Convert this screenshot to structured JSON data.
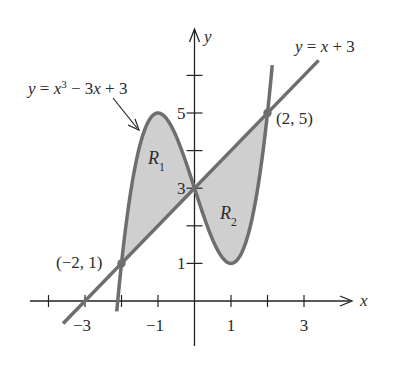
{
  "figure": {
    "curve_label": "y = x³ − 3x + 3",
    "curve_label_parts": {
      "y": "y",
      "eq": " = ",
      "x": "x",
      "exp": "3",
      "rest": " − 3",
      "x2": "x",
      "tail": " + 3"
    },
    "line_label_parts": {
      "y": "y",
      "eq": " = ",
      "x": "x",
      "tail": " + 3"
    },
    "line_label": "y = x + 3",
    "axis_x_label": "x",
    "axis_y_label": "y",
    "region_1": {
      "base": "R",
      "sub": "1"
    },
    "region_2": {
      "base": "R",
      "sub": "2"
    },
    "point_left": "(−2, 1)",
    "point_right": "(2, 5)",
    "x_ticks": [
      {
        "value": -3,
        "label": "−3"
      },
      {
        "value": -1,
        "label": "−1"
      },
      {
        "value": 1,
        "label": "1"
      },
      {
        "value": 3,
        "label": "3"
      }
    ],
    "y_ticks": [
      {
        "value": 1,
        "label": "1"
      },
      {
        "value": 3,
        "label": "3"
      },
      {
        "value": 5,
        "label": "5"
      }
    ],
    "colors": {
      "curve": "#6e6e6e",
      "fill": "#cfcfcf",
      "axis": "#222222",
      "point": "#6e6e6e"
    }
  }
}
